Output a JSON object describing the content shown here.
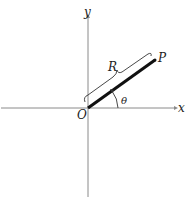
{
  "diagram": {
    "type": "polar-coordinate-figure",
    "labels": {
      "x_axis": "x",
      "y_axis": "y",
      "origin": "O",
      "point": "P",
      "radius": "R",
      "angle": "θ"
    },
    "colors": {
      "axes": "#888888",
      "rod": "#111111",
      "text": "#222222"
    }
  }
}
